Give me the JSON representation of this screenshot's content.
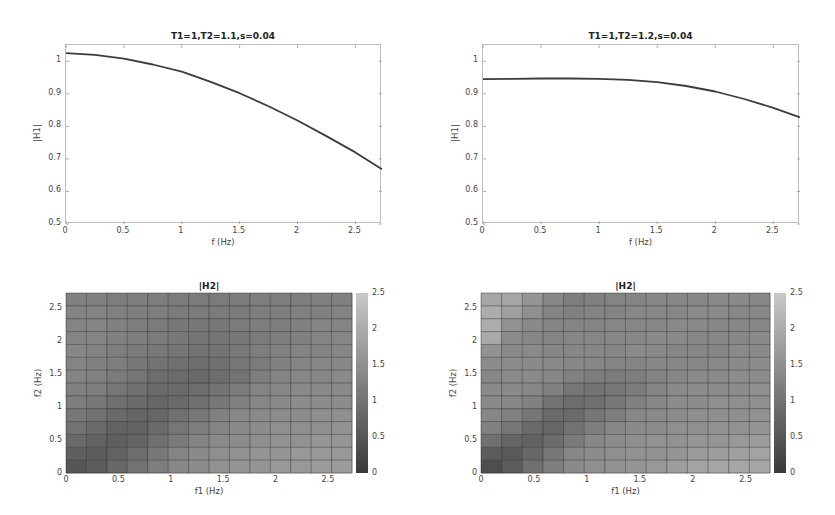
{
  "chart_data": [
    {
      "type": "line",
      "id": "top-left",
      "title": "T1=1,T2=1.1,s=0.04",
      "xlabel": "f (Hz)",
      "ylabel": "|H1|",
      "xlim": [
        0,
        2.73
      ],
      "ylim": [
        0.5,
        1.05
      ],
      "xticks": [
        "0",
        "0.5",
        "1",
        "1.5",
        "2",
        "2.5"
      ],
      "yticks": [
        "0.5",
        "0.6",
        "0.7",
        "0.8",
        "0.9",
        "1"
      ],
      "grid": false,
      "x": [
        0,
        0.25,
        0.5,
        0.75,
        1.0,
        1.25,
        1.5,
        1.75,
        2.0,
        2.25,
        2.5,
        2.73
      ],
      "values": [
        1.025,
        1.02,
        1.008,
        0.99,
        0.968,
        0.937,
        0.902,
        0.862,
        0.818,
        0.77,
        0.72,
        0.668
      ]
    },
    {
      "type": "line",
      "id": "top-right",
      "title": "T1=1,T2=1.2,s=0.04",
      "xlabel": "f (Hz)",
      "ylabel": "|H1|",
      "xlim": [
        0,
        2.73
      ],
      "ylim": [
        0.5,
        1.05
      ],
      "xticks": [
        "0",
        "0.5",
        "1",
        "1.5",
        "2",
        "2.5"
      ],
      "yticks": [
        "0.5",
        "0.6",
        "0.7",
        "0.8",
        "0.9",
        "1"
      ],
      "grid": false,
      "x": [
        0,
        0.25,
        0.5,
        0.75,
        1.0,
        1.25,
        1.5,
        1.75,
        2.0,
        2.25,
        2.5,
        2.73
      ],
      "values": [
        0.945,
        0.946,
        0.947,
        0.947,
        0.946,
        0.943,
        0.936,
        0.924,
        0.907,
        0.884,
        0.857,
        0.828
      ]
    },
    {
      "type": "heatmap",
      "id": "bottom-left",
      "title": "|H2|",
      "xlabel": "f1 (Hz)",
      "ylabel": "f2 (Hz)",
      "xlim": [
        0,
        2.73
      ],
      "ylim": [
        0,
        2.73
      ],
      "xticks": [
        "0",
        "0.5",
        "1",
        "1.5",
        "2",
        "2.5"
      ],
      "yticks": [
        "0",
        "0.5",
        "1",
        "1.5",
        "2",
        "2.5"
      ],
      "colorbar_ticks": [
        "0",
        "0.5",
        "1",
        "1.5",
        "2",
        "2.5"
      ],
      "clim": [
        0,
        2.5
      ],
      "colormap": "gray",
      "rows_top_to_bottom": [
        [
          1.25,
          1.25,
          1.2,
          1.2,
          1.2,
          1.15,
          1.15,
          1.15,
          1.15,
          1.2,
          1.2,
          1.2,
          1.25,
          1.25
        ],
        [
          1.3,
          1.3,
          1.25,
          1.2,
          1.2,
          1.15,
          1.15,
          1.15,
          1.15,
          1.2,
          1.2,
          1.25,
          1.25,
          1.3
        ],
        [
          1.3,
          1.3,
          1.25,
          1.2,
          1.15,
          1.1,
          1.1,
          1.1,
          1.15,
          1.2,
          1.2,
          1.25,
          1.3,
          1.3
        ],
        [
          1.3,
          1.3,
          1.25,
          1.2,
          1.15,
          1.1,
          1.05,
          1.05,
          1.1,
          1.15,
          1.2,
          1.25,
          1.3,
          1.35
        ],
        [
          1.35,
          1.3,
          1.2,
          1.15,
          1.1,
          1.05,
          1.0,
          1.0,
          1.1,
          1.2,
          1.25,
          1.3,
          1.3,
          1.35
        ],
        [
          1.3,
          1.25,
          1.2,
          1.1,
          1.0,
          0.95,
          0.9,
          0.95,
          1.05,
          1.15,
          1.25,
          1.3,
          1.35,
          1.35
        ],
        [
          1.3,
          1.25,
          1.15,
          1.05,
          0.9,
          0.85,
          0.85,
          0.9,
          1.0,
          1.2,
          1.3,
          1.35,
          1.35,
          1.4
        ],
        [
          1.25,
          1.2,
          1.05,
          0.95,
          0.85,
          0.85,
          0.9,
          1.0,
          1.15,
          1.3,
          1.35,
          1.4,
          1.4,
          1.4
        ],
        [
          1.2,
          1.1,
          0.95,
          0.85,
          0.8,
          0.85,
          0.95,
          1.1,
          1.25,
          1.35,
          1.4,
          1.45,
          1.45,
          1.45
        ],
        [
          1.1,
          1.0,
          0.85,
          0.75,
          0.8,
          0.95,
          1.1,
          1.25,
          1.35,
          1.4,
          1.45,
          1.45,
          1.5,
          1.5
        ],
        [
          1.0,
          0.85,
          0.7,
          0.7,
          0.85,
          1.05,
          1.2,
          1.3,
          1.4,
          1.45,
          1.5,
          1.5,
          1.5,
          1.55
        ],
        [
          0.85,
          0.7,
          0.65,
          0.75,
          0.95,
          1.15,
          1.3,
          1.4,
          1.45,
          1.5,
          1.55,
          1.55,
          1.6,
          1.6
        ],
        [
          0.65,
          0.6,
          0.7,
          0.9,
          1.1,
          1.3,
          1.4,
          1.5,
          1.55,
          1.6,
          1.6,
          1.65,
          1.65,
          1.65
        ],
        [
          0.5,
          0.6,
          0.8,
          1.0,
          1.2,
          1.35,
          1.45,
          1.55,
          1.6,
          1.6,
          1.65,
          1.65,
          1.7,
          1.7
        ]
      ]
    },
    {
      "type": "heatmap",
      "id": "bottom-right",
      "title": "|H2|",
      "xlabel": "f1 (Hz)",
      "ylabel": "f2 (Hz)",
      "xlim": [
        0,
        2.73
      ],
      "ylim": [
        0,
        2.73
      ],
      "xticks": [
        "0",
        "0.5",
        "1",
        "1.5",
        "2",
        "2.5"
      ],
      "yticks": [
        "0",
        "0.5",
        "1",
        "1.5",
        "2",
        "2.5"
      ],
      "colorbar_ticks": [
        "0",
        "0.5",
        "1",
        "1.5",
        "2",
        "2.5"
      ],
      "clim": [
        0,
        2.5
      ],
      "colormap": "gray",
      "rows_top_to_bottom": [
        [
          1.9,
          1.9,
          1.6,
          1.35,
          1.2,
          1.25,
          1.3,
          1.3,
          1.35,
          1.35,
          1.35,
          1.4,
          1.4,
          1.35
        ],
        [
          2.0,
          1.8,
          1.5,
          1.3,
          1.25,
          1.3,
          1.3,
          1.35,
          1.35,
          1.35,
          1.4,
          1.4,
          1.35,
          1.35
        ],
        [
          2.0,
          1.55,
          1.4,
          1.3,
          1.3,
          1.3,
          1.35,
          1.35,
          1.35,
          1.4,
          1.4,
          1.35,
          1.35,
          1.35
        ],
        [
          1.95,
          1.45,
          1.35,
          1.3,
          1.35,
          1.35,
          1.35,
          1.35,
          1.4,
          1.4,
          1.35,
          1.35,
          1.35,
          1.4
        ],
        [
          1.55,
          1.4,
          1.4,
          1.35,
          1.35,
          1.35,
          1.35,
          1.4,
          1.4,
          1.35,
          1.35,
          1.35,
          1.4,
          1.4
        ],
        [
          1.45,
          1.45,
          1.4,
          1.4,
          1.35,
          1.35,
          1.3,
          1.3,
          1.35,
          1.35,
          1.35,
          1.4,
          1.4,
          1.45
        ],
        [
          1.35,
          1.4,
          1.4,
          1.35,
          1.25,
          1.2,
          1.15,
          1.2,
          1.3,
          1.35,
          1.4,
          1.4,
          1.45,
          1.45
        ],
        [
          1.4,
          1.4,
          1.35,
          1.25,
          1.05,
          1.0,
          1.05,
          1.15,
          1.3,
          1.4,
          1.45,
          1.45,
          1.45,
          1.5
        ],
        [
          1.4,
          1.35,
          1.25,
          1.0,
          0.9,
          0.95,
          1.1,
          1.25,
          1.35,
          1.45,
          1.45,
          1.5,
          1.5,
          1.5
        ],
        [
          1.35,
          1.25,
          1.05,
          0.85,
          0.85,
          1.05,
          1.2,
          1.35,
          1.4,
          1.45,
          1.5,
          1.5,
          1.5,
          1.55
        ],
        [
          1.25,
          1.1,
          0.85,
          0.8,
          1.0,
          1.2,
          1.35,
          1.4,
          1.45,
          1.5,
          1.5,
          1.55,
          1.55,
          1.6
        ],
        [
          0.95,
          0.75,
          0.7,
          0.9,
          1.15,
          1.35,
          1.45,
          1.5,
          1.55,
          1.55,
          1.6,
          1.6,
          1.65,
          1.7
        ],
        [
          0.6,
          0.55,
          0.8,
          1.1,
          1.35,
          1.45,
          1.5,
          1.55,
          1.55,
          1.6,
          1.7,
          1.75,
          1.8,
          1.85
        ],
        [
          0.35,
          0.6,
          0.95,
          1.2,
          1.4,
          1.5,
          1.55,
          1.6,
          1.65,
          1.75,
          1.85,
          1.9,
          1.9,
          1.9
        ]
      ]
    }
  ],
  "panels": {
    "tl": {
      "title": "T1=1,T2=1.1,s=0.04",
      "xlabel": "f (Hz)",
      "ylabel": "|H1|"
    },
    "tr": {
      "title": "T1=1,T2=1.2,s=0.04",
      "xlabel": "f (Hz)",
      "ylabel": "|H1|"
    },
    "bl": {
      "title": "|H2|",
      "xlabel": "f1 (Hz)",
      "ylabel": "f2 (Hz)"
    },
    "br": {
      "title": "|H2|",
      "xlabel": "f1 (Hz)",
      "ylabel": "f2 (Hz)"
    }
  }
}
